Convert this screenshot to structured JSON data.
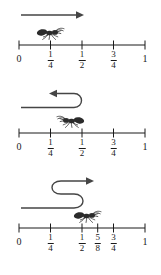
{
  "figure": {
    "background_color": "#ffffff",
    "ink_color": "#1a1a1a",
    "arrow_color": "#454545",
    "axis": {
      "x_start_px": 19,
      "x_end_px": 145,
      "domain": [
        0,
        1
      ]
    }
  },
  "panels": [
    {
      "id": "panel-1",
      "name": "first-number-line",
      "ticks": [
        {
          "value": 0,
          "type": "whole",
          "label": "0",
          "num": "",
          "den": ""
        },
        {
          "value": 0.25,
          "type": "frac",
          "label": "1/4",
          "num": "1",
          "den": "4"
        },
        {
          "value": 0.5,
          "type": "frac",
          "label": "1/2",
          "num": "1",
          "den": "2"
        },
        {
          "value": 0.75,
          "type": "frac",
          "label": "3/4",
          "num": "3",
          "den": "4"
        },
        {
          "value": 1,
          "type": "whole",
          "label": "1",
          "num": "",
          "den": ""
        }
      ],
      "ant": {
        "position": 0.25,
        "facing": "right"
      },
      "arrow": {
        "shape": "straight",
        "direction": "right",
        "from": 0.06,
        "to": 0.5
      }
    },
    {
      "id": "panel-2",
      "name": "second-number-line",
      "ticks": [
        {
          "value": 0,
          "type": "whole",
          "label": "0",
          "num": "",
          "den": ""
        },
        {
          "value": 0.25,
          "type": "frac",
          "label": "1/4",
          "num": "1",
          "den": "4"
        },
        {
          "value": 0.5,
          "type": "frac",
          "label": "1/2",
          "num": "1",
          "den": "2"
        },
        {
          "value": 0.75,
          "type": "frac",
          "label": "3/4",
          "num": "3",
          "den": "4"
        },
        {
          "value": 1,
          "type": "whole",
          "label": "1",
          "num": "",
          "den": ""
        }
      ],
      "ant": {
        "position": 0.4,
        "facing": "left"
      },
      "arrow": {
        "shape": "u-turn",
        "direction": "left",
        "from": 0.5,
        "to": 0.35
      }
    },
    {
      "id": "panel-3",
      "name": "third-number-line",
      "ticks": [
        {
          "value": 0,
          "type": "whole",
          "label": "0",
          "num": "",
          "den": ""
        },
        {
          "value": 0.25,
          "type": "frac",
          "label": "1/4",
          "num": "1",
          "den": "4"
        },
        {
          "value": 0.5,
          "type": "frac",
          "label": "1/2",
          "num": "1",
          "den": "2"
        },
        {
          "value": 0.625,
          "type": "frac",
          "label": "5/8",
          "num": "5",
          "den": "8"
        },
        {
          "value": 0.75,
          "type": "frac",
          "label": "3/4",
          "num": "3",
          "den": "4"
        },
        {
          "value": 1,
          "type": "whole",
          "label": "1",
          "num": "",
          "den": ""
        }
      ],
      "ant": {
        "position": 0.55,
        "facing": "right"
      },
      "arrow": {
        "shape": "s-curve",
        "direction": "right",
        "from": 0.06,
        "to": 0.5
      }
    }
  ]
}
